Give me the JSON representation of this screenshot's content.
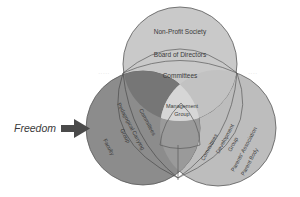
{
  "diagram": {
    "type": "three-circle venn (organizational structure)",
    "input_label": "Freedom",
    "colors": {
      "background": "#ffffff",
      "top_circle": "#c9c9c9",
      "left_circle": "#8c8c8c",
      "left_top_overlap": "#747474",
      "right_circle": "#bdbdbd",
      "center": "#d6d6d6",
      "stroke": "#5a5a5a",
      "arrow": "#4a4a4a",
      "text": "#3a3a3a"
    },
    "top_circle": {
      "outer_label": "Non-Profit Society",
      "middle_label": "Board of Directors",
      "inner_label": "Committees"
    },
    "left_circle": {
      "outer_label": "Faculty",
      "middle_label": "Pedagogical Carrying Group",
      "middle_label_lines": [
        "Pedagogical Carrying",
        "Group"
      ],
      "inner_label": "Committees"
    },
    "right_circle": {
      "outer_label": "Parents' Association Parent Body",
      "outer_label_lines": [
        "Parents' Association",
        "Parent Body"
      ],
      "middle_label": "Development Group",
      "middle_label_lines": [
        "Development",
        "Group"
      ],
      "inner_label": "Committees"
    },
    "center": {
      "label": "Management Group",
      "label_lines": [
        "Management",
        "Group"
      ]
    }
  }
}
